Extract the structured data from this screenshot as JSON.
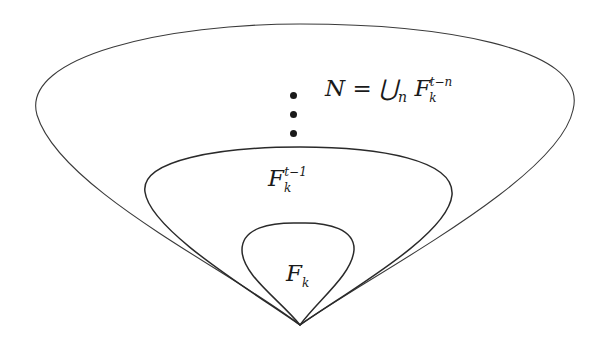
{
  "diagram": {
    "type": "nested-sets",
    "colors": {
      "stroke": "#2a2a2a",
      "background": "#ffffff",
      "text": "#1a1a1a"
    },
    "regions": [
      {
        "id": "outer",
        "label": {
          "base": "N = ⋃",
          "sub_union": "n",
          "set": "F",
          "sub": "k",
          "sup": "t−n"
        }
      },
      {
        "id": "middle",
        "label": {
          "set": "F",
          "sub": "k",
          "sup": "t−1"
        }
      },
      {
        "id": "inner",
        "label": {
          "set": "F",
          "sub": "k"
        }
      }
    ],
    "ellipsis": "vertical dots (⋮) between middle and outer region"
  }
}
